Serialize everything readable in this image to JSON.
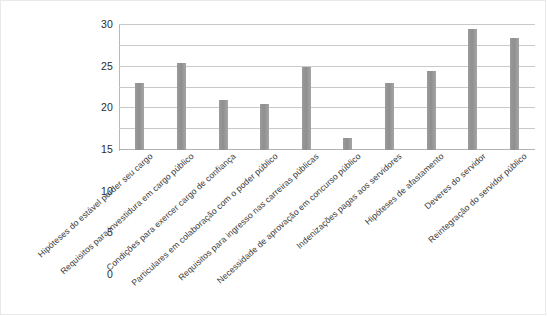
{
  "chart_data": {
    "type": "bar",
    "title": "",
    "xlabel": "",
    "ylabel": "",
    "ylim": [
      0,
      30
    ],
    "ytick_step": 5,
    "yticks": [
      0,
      5,
      10,
      15,
      20,
      25,
      30
    ],
    "grid": true,
    "legend": "none",
    "bar_color": "#999999",
    "gridline_color": "#c9c9c9",
    "categories": [
      "Hipóteses do estável perder seu cargo",
      "Requisitos para investidura em cargo público",
      "Condições para exercer cargo de confiança",
      "Particulares em colaboração com o poder público",
      "Requisitos para ingresso nas carreiras públicas",
      "Necessidade de aprovação em concurso público",
      "Indenizações pagas aos servidores",
      "Hipóteses de afastamento",
      "Deveres do servidor",
      "Reintegração do servidor público"
    ],
    "values": [
      16,
      21,
      12,
      11,
      20,
      3,
      16,
      19,
      29,
      27
    ]
  }
}
